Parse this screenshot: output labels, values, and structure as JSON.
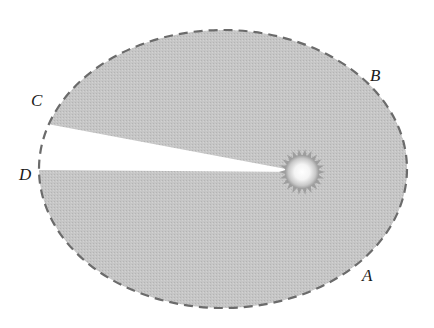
{
  "diagram": {
    "type": "kepler-second-law-orbit",
    "orbit": {
      "cx": 223,
      "cy": 169,
      "rx": 184,
      "ry": 139,
      "stroke": "#6b6b6b",
      "dash": "9 6"
    },
    "sun": {
      "cx": 302,
      "cy": 172,
      "r": 15,
      "spike_r": 23,
      "spikes": 22
    },
    "sector_color": "#c4c4c4",
    "sectors": [
      {
        "name": "sector-AB",
        "from": "A",
        "to": "B"
      },
      {
        "name": "sector-CD",
        "from": "C",
        "to": "D"
      }
    ],
    "points": {
      "A": {
        "label": "A",
        "x": 366,
        "y": 261,
        "lx": 362,
        "ly": 281
      },
      "B": {
        "label": "B",
        "x": 367,
        "y": 85,
        "lx": 370,
        "ly": 81
      },
      "C": {
        "label": "C",
        "x": 48,
        "y": 124,
        "lx": 31,
        "ly": 106
      },
      "D": {
        "label": "D",
        "x": 40,
        "y": 170,
        "lx": 19,
        "ly": 180
      }
    }
  }
}
